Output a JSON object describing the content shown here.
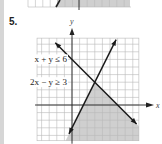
{
  "problem_number": "5.",
  "chart_data": {
    "type": "area",
    "title": "",
    "xlabel": "x",
    "ylabel": "y",
    "xlim": [
      -4.6,
      8.8
    ],
    "ylim": [
      -4.7,
      8.8
    ],
    "grid": true,
    "grid_step": 1,
    "inequalities": [
      {
        "label": "x + y ≤ 6",
        "boundary": {
          "slope": -1,
          "intercept": 6
        },
        "side": "below"
      },
      {
        "label": "2x − y ≥ 3",
        "boundary": {
          "slope": 2,
          "intercept": -3
        },
        "side": "below"
      }
    ],
    "lines": [
      {
        "name": "x + y = 6",
        "from": [
          -2.2,
          8.2
        ],
        "to": [
          8.5,
          -2.5
        ]
      },
      {
        "name": "2x − y = 3",
        "from": [
          -0.4,
          -3.8
        ],
        "to": [
          5.8,
          8.6
        ]
      }
    ],
    "intersection": [
      3,
      3
    ],
    "shading_color": "#cfcfcf",
    "line_color": "#1a1a1a",
    "grid_color": "#b8b8b8"
  },
  "previous_graph_fragment": {
    "note_visible": "bottom edge of previous exercise graph, partially shaded"
  }
}
